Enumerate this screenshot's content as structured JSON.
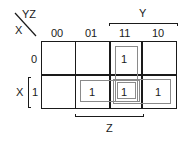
{
  "kmap": {
    "corner": {
      "col_vars": "YZ",
      "row_var": "X"
    },
    "col_headers": [
      "00",
      "01",
      "11",
      "10"
    ],
    "row_headers": [
      "0",
      "1"
    ],
    "col_span_label": "Y",
    "col_span_bottom_label": "Z",
    "row_span_label": "X",
    "cells": [
      [
        "",
        "",
        "1",
        ""
      ],
      [
        "",
        "1",
        "1",
        "1"
      ]
    ],
    "groups": [
      {
        "name": "Y·Z",
        "cells": [
          [
            0,
            2
          ],
          [
            1,
            2
          ]
        ]
      },
      {
        "name": "X·Z",
        "cells": [
          [
            1,
            1
          ],
          [
            1,
            2
          ]
        ]
      },
      {
        "name": "X·Y",
        "cells": [
          [
            1,
            2
          ],
          [
            1,
            3
          ]
        ]
      }
    ],
    "colors": {
      "grid": "#1a1a1a",
      "group": "#8a8a8a"
    }
  }
}
